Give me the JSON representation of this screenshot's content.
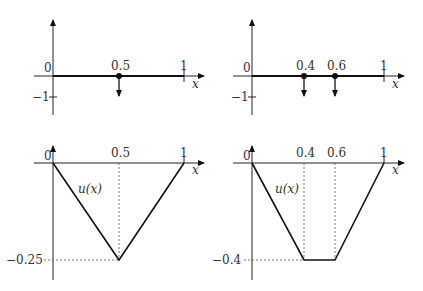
{
  "panels": {
    "top_left": {
      "origin_label": "0",
      "minus_one_label": "−1",
      "point_label": "0.5",
      "one_label": "1",
      "x_axis_label": "x",
      "load_points": [
        0.5
      ]
    },
    "top_right": {
      "origin_label": "0",
      "minus_one_label": "−1",
      "point_labels": [
        "0.4",
        "0.6"
      ],
      "one_label": "1",
      "x_axis_label": "x",
      "load_points": [
        0.4,
        0.6
      ]
    },
    "bottom_left": {
      "origin_label": "0",
      "mid_label": "0.5",
      "one_label": "1",
      "x_axis_label": "x",
      "curve_label": "u(x)",
      "min_label": "−0.25",
      "curve_points": [
        [
          0,
          0
        ],
        [
          0.5,
          -0.25
        ],
        [
          1,
          0
        ]
      ]
    },
    "bottom_right": {
      "origin_label": "0",
      "left_label": "0.4",
      "right_label": "0.6",
      "one_label": "1",
      "x_axis_label": "x",
      "curve_label": "u(x)",
      "min_label": "−0.4",
      "curve_points": [
        [
          0,
          0
        ],
        [
          0.4,
          -0.4
        ],
        [
          0.6,
          -0.4
        ],
        [
          1,
          0
        ]
      ]
    }
  },
  "colors": {
    "line": "#111111",
    "axis": "#222222",
    "dashed": "#555555"
  }
}
